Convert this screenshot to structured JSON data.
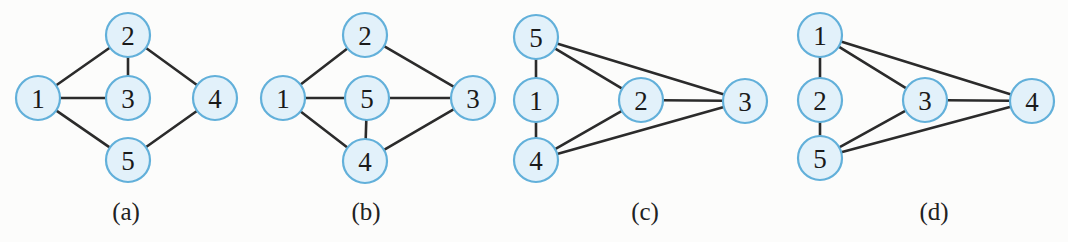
{
  "figure": {
    "width": 1068,
    "height": 242,
    "background_color": "#fcfcfb",
    "node_fill_color": "#e2f1fa",
    "node_stroke_color": "#62b0da",
    "edge_color": "#2b2b2b",
    "node_radius": 22
  },
  "chart_data": {
    "type": "diagram",
    "subtype": "graph-node-link",
    "title": "",
    "panels": [
      {
        "caption": "(a)",
        "caption_x": 126,
        "caption_y": 220,
        "nodes": [
          {
            "id": "a1",
            "label": "1",
            "x": 38,
            "y": 98
          },
          {
            "id": "a2",
            "label": "2",
            "x": 128,
            "y": 35
          },
          {
            "id": "a3",
            "label": "3",
            "x": 128,
            "y": 98
          },
          {
            "id": "a4",
            "label": "4",
            "x": 215,
            "y": 98
          },
          {
            "id": "a5",
            "label": "5",
            "x": 128,
            "y": 160
          }
        ],
        "edges": [
          [
            "a1",
            "a2"
          ],
          [
            "a1",
            "a3"
          ],
          [
            "a1",
            "a5"
          ],
          [
            "a2",
            "a3"
          ],
          [
            "a2",
            "a4"
          ],
          [
            "a4",
            "a5"
          ]
        ]
      },
      {
        "caption": "(b)",
        "caption_x": 366,
        "caption_y": 220,
        "nodes": [
          {
            "id": "b1",
            "label": "1",
            "x": 283,
            "y": 98
          },
          {
            "id": "b2",
            "label": "2",
            "x": 365,
            "y": 35
          },
          {
            "id": "b5",
            "label": "5",
            "x": 367,
            "y": 98
          },
          {
            "id": "b3",
            "label": "3",
            "x": 473,
            "y": 98
          },
          {
            "id": "b4",
            "label": "4",
            "x": 365,
            "y": 161
          }
        ],
        "edges": [
          [
            "b1",
            "b2"
          ],
          [
            "b2",
            "b3"
          ],
          [
            "b1",
            "b5"
          ],
          [
            "b5",
            "b3"
          ],
          [
            "b1",
            "b4"
          ],
          [
            "b5",
            "b4"
          ],
          [
            "b4",
            "b3"
          ]
        ]
      },
      {
        "caption": "(c)",
        "caption_x": 645,
        "caption_y": 220,
        "nodes": [
          {
            "id": "c5",
            "label": "5",
            "x": 536,
            "y": 37
          },
          {
            "id": "c1",
            "label": "1",
            "x": 536,
            "y": 100
          },
          {
            "id": "c4",
            "label": "4",
            "x": 536,
            "y": 160
          },
          {
            "id": "c2",
            "label": "2",
            "x": 641,
            "y": 100
          },
          {
            "id": "c3",
            "label": "3",
            "x": 745,
            "y": 101
          }
        ],
        "edges": [
          [
            "c5",
            "c1"
          ],
          [
            "c1",
            "c4"
          ],
          [
            "c5",
            "c2"
          ],
          [
            "c5",
            "c3"
          ],
          [
            "c2",
            "c3"
          ],
          [
            "c4",
            "c2"
          ],
          [
            "c4",
            "c3"
          ]
        ]
      },
      {
        "caption": "(d)",
        "caption_x": 934,
        "caption_y": 220,
        "nodes": [
          {
            "id": "d1",
            "label": "1",
            "x": 820,
            "y": 35
          },
          {
            "id": "d2",
            "label": "2",
            "x": 820,
            "y": 100
          },
          {
            "id": "d5",
            "label": "5",
            "x": 820,
            "y": 158
          },
          {
            "id": "d3",
            "label": "3",
            "x": 925,
            "y": 100
          },
          {
            "id": "d4",
            "label": "4",
            "x": 1032,
            "y": 101
          }
        ],
        "edges": [
          [
            "d1",
            "d2"
          ],
          [
            "d2",
            "d5"
          ],
          [
            "d1",
            "d3"
          ],
          [
            "d1",
            "d4"
          ],
          [
            "d3",
            "d4"
          ],
          [
            "d5",
            "d3"
          ],
          [
            "d5",
            "d4"
          ]
        ]
      }
    ]
  }
}
